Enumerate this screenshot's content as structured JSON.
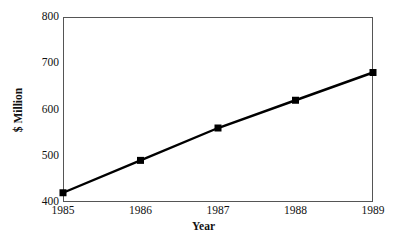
{
  "chart_data": {
    "type": "line",
    "title": "",
    "xlabel": "Year",
    "ylabel": "$ Million",
    "categories": [
      "1985",
      "1986",
      "1987",
      "1988",
      "1989"
    ],
    "x": [
      1985,
      1986,
      1987,
      1988,
      1989
    ],
    "values": [
      420,
      490,
      560,
      620,
      680
    ],
    "series": [
      {
        "name": "",
        "values": [
          420,
          490,
          560,
          620,
          680
        ]
      }
    ],
    "xlim": [
      1985,
      1989
    ],
    "ylim": [
      400,
      800
    ],
    "yticks": [
      400,
      500,
      600,
      700,
      800
    ],
    "ytick_labels": [
      "400",
      "500",
      "600",
      "700",
      "800"
    ],
    "xticks": [
      1985,
      1986,
      1987,
      1988,
      1989
    ],
    "xtick_labels": [
      "1985",
      "1986",
      "1987",
      "1988",
      "1989"
    ],
    "grid": false,
    "legend": false,
    "legend_position": "none",
    "marker": "filled-square",
    "line_color": "#000000",
    "marker_color": "#000000",
    "frame_color": "#555555",
    "background_color": "#ffffff",
    "annotations": []
  }
}
